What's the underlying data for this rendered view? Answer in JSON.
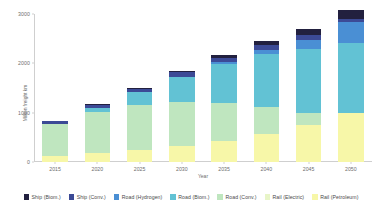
{
  "chart_data": {
    "type": "bar",
    "stacked": true,
    "title": "",
    "xlabel": "Year",
    "ylabel": "Million freight km",
    "categories": [
      "2015",
      "2020",
      "2025",
      "2030",
      "2035",
      "2040",
      "2045",
      "2050"
    ],
    "xtick_labels": [
      "2015",
      "2020",
      "2025",
      "2030",
      "2035",
      "2040",
      "2045",
      "2050"
    ],
    "ytick_labels": [
      "0",
      "1000",
      "2000",
      "3000"
    ],
    "ytick_values": [
      0,
      1000,
      2000,
      3000
    ],
    "ylim": [
      0,
      3000
    ],
    "grid": false,
    "legend_position": "bottom",
    "series": [
      {
        "name": "Rail (Petroleum)",
        "color": "#f7f7a8",
        "values": [
          130,
          180,
          250,
          330,
          430,
          560,
          760,
          1000
        ]
      },
      {
        "name": "Rail (Electric)",
        "color": "#e8f5c8",
        "values": [
          0,
          0,
          0,
          0,
          0,
          0,
          0,
          0
        ]
      },
      {
        "name": "Road (Conv.)",
        "color": "#bfe6bf",
        "values": [
          640,
          830,
          900,
          880,
          760,
          560,
          230,
          0
        ]
      },
      {
        "name": "Road (Biom.)",
        "color": "#62c2d4",
        "values": [
          0,
          80,
          260,
          520,
          800,
          1060,
          1300,
          1420
        ]
      },
      {
        "name": "Road (Hydrogen)",
        "color": "#4a8fd4",
        "values": [
          0,
          0,
          0,
          0,
          30,
          90,
          180,
          420
        ]
      },
      {
        "name": "Ship (Conv.)",
        "color": "#3c4a96",
        "values": [
          60,
          75,
          80,
          85,
          90,
          95,
          100,
          60
        ]
      },
      {
        "name": "Ship (Biom.)",
        "color": "#22203f",
        "values": [
          0,
          10,
          20,
          35,
          55,
          85,
          130,
          180
        ]
      }
    ],
    "stack_order": [
      "Rail (Petroleum)",
      "Rail (Electric)",
      "Road (Conv.)",
      "Road (Biom.)",
      "Road (Hydrogen)",
      "Ship (Conv.)",
      "Ship (Biom.)"
    ],
    "legend_entries": [
      {
        "label": "Ship (Biom.)",
        "color": "#22203f"
      },
      {
        "label": "Ship (Conv.)",
        "color": "#3c4a96"
      },
      {
        "label": "Road (Hydrogen)",
        "color": "#4a8fd4"
      },
      {
        "label": "Road (Biom.)",
        "color": "#62c2d4"
      },
      {
        "label": "Road (Conv.)",
        "color": "#bfe6bf"
      },
      {
        "label": "Rail (Electric)",
        "color": "#e8f5c8"
      },
      {
        "label": "Rail (Petroleum)",
        "color": "#f7f7a8"
      }
    ]
  }
}
